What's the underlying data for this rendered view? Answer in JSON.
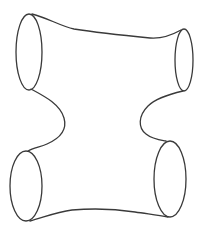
{
  "figure": {
    "stroke_color": "#3a3a3a",
    "background_color": "#ffffff",
    "boundary_count": 4,
    "boundaries": [
      {
        "name": "top-left-boundary"
      },
      {
        "name": "top-right-boundary"
      },
      {
        "name": "bottom-left-boundary"
      },
      {
        "name": "bottom-right-boundary"
      }
    ]
  }
}
